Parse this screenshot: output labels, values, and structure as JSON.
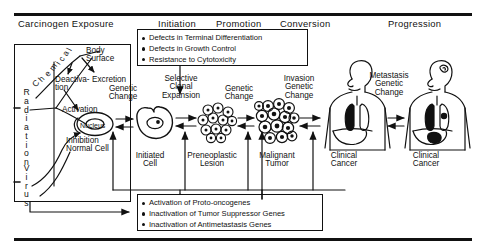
{
  "header": {
    "stages": [
      {
        "label": "Carcinogen  Exposure",
        "x": 18
      },
      {
        "label": "Initiation",
        "x": 158
      },
      {
        "label": "Promotion",
        "x": 216
      },
      {
        "label": "Conversion",
        "x": 280
      },
      {
        "label": "Progression",
        "x": 388
      }
    ]
  },
  "top_box": {
    "items": [
      "Defects in Terminal Differentiation",
      "Defects in Growth Control",
      "Resistance to Cytotoxicity"
    ]
  },
  "bottom_box": {
    "items": [
      "Activation of  Proto-oncogenes",
      "Inactivation of  Tumor Suppressor Genes",
      "Inactivation of  Antimetastasis Genes"
    ]
  },
  "agents": {
    "chemical": "Chemical",
    "radiation": "Radiation",
    "virus": "Virus"
  },
  "fate_labels": {
    "body_surface": "Body\nSurface",
    "deactivation": "Deactiva-\ntion",
    "excretion": "Excretion",
    "activation": "Activation",
    "nucleus": "Nucleus",
    "inhibition": "Inhibition\nNormal Cell"
  },
  "transitions": [
    {
      "name": "genetic-change-1",
      "label": "Genetic\nChange"
    },
    {
      "name": "selective-clonal-expansion",
      "label": "Selective\nClonal\nExpansion"
    },
    {
      "name": "genetic-change-2",
      "label": "Genetic\nChange"
    },
    {
      "name": "invasion-genetic-change",
      "label": "Invasion\nGenetic\nChange"
    },
    {
      "name": "metastasis-genetic-change",
      "label": "Metastasis\nGenetic\nChange"
    }
  ],
  "stages": [
    {
      "name": "initiated-cell",
      "label": "Initiated\nCell"
    },
    {
      "name": "preneoplastic-lesion",
      "label": "Preneoplastic\nLesion"
    },
    {
      "name": "malignant-tumor",
      "label": "Malignant\nTumor"
    },
    {
      "name": "clinical-cancer-1",
      "label": "Clinical\nCancer"
    },
    {
      "name": "clinical-cancer-2",
      "label": "Clinical\nCancer"
    }
  ],
  "colors": {
    "ink": "#111111",
    "paper": "#ffffff"
  }
}
